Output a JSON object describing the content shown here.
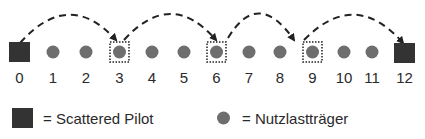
{
  "diagram": {
    "nodes": [
      {
        "index": 0,
        "label": "0",
        "type": "pilot"
      },
      {
        "index": 1,
        "label": "1",
        "type": "carrier"
      },
      {
        "index": 2,
        "label": "2",
        "type": "carrier"
      },
      {
        "index": 3,
        "label": "3",
        "type": "carrier",
        "highlighted": true
      },
      {
        "index": 4,
        "label": "4",
        "type": "carrier"
      },
      {
        "index": 5,
        "label": "5",
        "type": "carrier"
      },
      {
        "index": 6,
        "label": "6",
        "type": "carrier",
        "highlighted": true
      },
      {
        "index": 7,
        "label": "7",
        "type": "carrier"
      },
      {
        "index": 8,
        "label": "8",
        "type": "carrier"
      },
      {
        "index": 9,
        "label": "9",
        "type": "carrier",
        "highlighted": true
      },
      {
        "index": 10,
        "label": "10",
        "type": "carrier"
      },
      {
        "index": 11,
        "label": "11",
        "type": "carrier"
      },
      {
        "index": 12,
        "label": "12",
        "type": "pilot"
      }
    ],
    "arcs": [
      {
        "from": 0,
        "to": 3
      },
      {
        "from": 3,
        "to": 6
      },
      {
        "from": 6,
        "to": 9
      },
      {
        "from": 9,
        "to": 12
      }
    ],
    "colors": {
      "pilot": "#333333",
      "carrier": "#6e6e6e",
      "line": "#222222"
    }
  },
  "legend": {
    "pilot_label": "= Scattered Pilot",
    "carrier_label": "= Nutzlastträger"
  }
}
